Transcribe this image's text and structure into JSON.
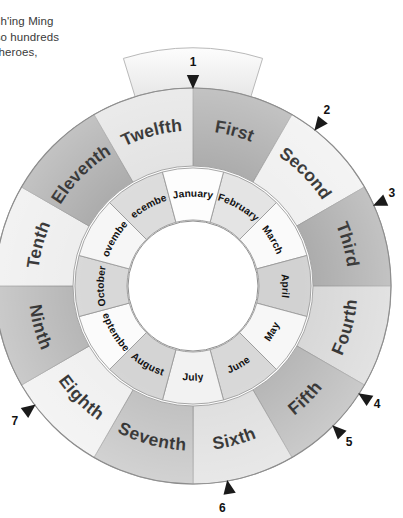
{
  "page": {
    "background_color": "#ffffff"
  },
  "body_text": {
    "lines": [
      "Ch'ing Ming",
      "lso hundreds",
      ", heroes,"
    ]
  },
  "wheel": {
    "center": {
      "x": 193,
      "y": 286
    },
    "radii": {
      "hub": 64,
      "inner_ring_outer": 118,
      "outer_ring_outer": 198
    },
    "tab": {
      "label": "",
      "top": 46,
      "bottom": 92
    },
    "outer_ring": {
      "name": "ordinal-month-ring",
      "segments": [
        {
          "label": "First",
          "fill": "#a9a9a9"
        },
        {
          "label": "Second",
          "fill": "#efefef"
        },
        {
          "label": "Third",
          "fill": "#a9a9a9"
        },
        {
          "label": "Fourth",
          "fill": "#d6d6d6"
        },
        {
          "label": "Fifth",
          "fill": "#b4b4b4"
        },
        {
          "label": "Sixth",
          "fill": "#dedede"
        },
        {
          "label": "Seventh",
          "fill": "#bfbfbf"
        },
        {
          "label": "Eighth",
          "fill": "#efefef"
        },
        {
          "label": "Ninth",
          "fill": "#b4b4b4"
        },
        {
          "label": "Tenth",
          "fill": "#ededed"
        },
        {
          "label": "Eleventh",
          "fill": "#a9a9a9"
        },
        {
          "label": "Twelfth",
          "fill": "#e2e2e2"
        }
      ]
    },
    "inner_ring": {
      "name": "gregorian-month-ring",
      "segments": [
        {
          "label": "February",
          "fill": "#e4e4e4"
        },
        {
          "label": "March",
          "fill": "#fafafa"
        },
        {
          "label": "April",
          "fill": "#d2d2d2"
        },
        {
          "label": "May",
          "fill": "#f7f7f7"
        },
        {
          "label": "June",
          "fill": "#d8d8d8"
        },
        {
          "label": "July",
          "fill": "#f2f2f2"
        },
        {
          "label": "August",
          "fill": "#d4d4d4"
        },
        {
          "label": "September",
          "fill": "#fbfbfb"
        },
        {
          "label": "October",
          "fill": "#d8d8d8"
        },
        {
          "label": "November",
          "fill": "#f6f6f6"
        },
        {
          "label": "December",
          "fill": "#dcdcdc"
        },
        {
          "label": "January",
          "fill": "#fdfdfd"
        }
      ]
    },
    "markers": [
      {
        "label": "1",
        "angle_deg": -90,
        "num_dx": 0,
        "num_dy": -26
      },
      {
        "label": "2",
        "angle_deg": -52,
        "num_dx": 12,
        "num_dy": -20
      },
      {
        "label": "3",
        "angle_deg": -24,
        "num_dx": 18,
        "num_dy": -12
      },
      {
        "label": "4",
        "angle_deg": 33,
        "num_dx": 18,
        "num_dy": 10
      },
      {
        "label": "5",
        "angle_deg": 45,
        "num_dx": 16,
        "num_dy": 16
      },
      {
        "label": "6",
        "angle_deg": 80,
        "num_dx": -5,
        "num_dy": 27
      },
      {
        "label": "7",
        "angle_deg": 143,
        "num_dx": -20,
        "num_dy": 16
      }
    ]
  }
}
